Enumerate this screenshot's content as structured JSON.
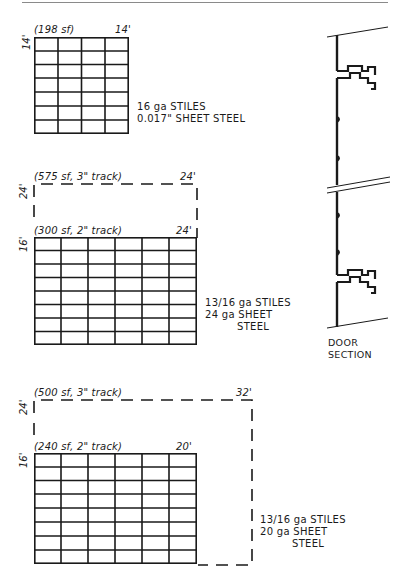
{
  "header_rule": {
    "color": "#8a8a8a"
  },
  "panels": [
    {
      "id": "panel-1",
      "area_label": "(198 sf)",
      "width_label": "14'",
      "height_label": "14'",
      "grid": {
        "columns": 4,
        "rows": 7
      },
      "spec": [
        "16 ga STILES",
        "0.017\" SHEET STEEL"
      ]
    },
    {
      "id": "panel-2",
      "outer": {
        "area_label": "(575 sf, 3\" track)",
        "width_label": "24'",
        "height_label": "24'"
      },
      "area_label": "(300 sf, 2\" track)",
      "width_label": "24'",
      "height_label": "16'",
      "grid": {
        "columns": 6,
        "rows": 8
      },
      "spec": [
        "13/16 ga STILES",
        "24 ga SHEET",
        "STEEL"
      ]
    },
    {
      "id": "panel-3",
      "outer": {
        "area_label": "(500 sf, 3\" track)",
        "width_label": "32'",
        "height_label": "24'"
      },
      "area_label": "(240 sf, 2\" track)",
      "width_label": "20'",
      "height_label": "16'",
      "grid": {
        "columns": 6,
        "rows": 8
      },
      "spec": [
        "13/16 ga STILES",
        "20 ga SHEET",
        "STEEL"
      ]
    }
  ],
  "door_section": {
    "caption": [
      "DOOR",
      "SECTION"
    ]
  },
  "colors": {
    "ink": "#1a1a1a",
    "rule": "#8a8a8a"
  }
}
